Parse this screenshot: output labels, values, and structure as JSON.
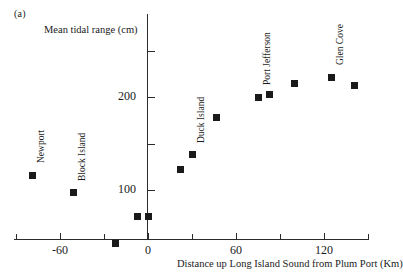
{
  "panel": {
    "label": "(a)"
  },
  "chart_data": {
    "type": "scatter",
    "title": "",
    "xlabel": "Distance up Long Island Sound from Plum Port (Km)",
    "ylabel": "Mean tidal range (cm)",
    "xlim": [
      -90,
      150
    ],
    "ylim": [
      0,
      270
    ],
    "grid": false,
    "legend": "none",
    "x_major_ticks": [
      -60,
      0,
      60,
      120
    ],
    "x_minor_ticks": [
      -90,
      -30,
      30,
      90,
      150
    ],
    "x_tick_labels": [
      "-60",
      "0",
      "60",
      "120"
    ],
    "y_major_ticks": [
      100,
      200
    ],
    "y_minor_ticks": [
      150,
      250
    ],
    "y_tick_labels": [
      "100",
      "200"
    ],
    "marker": "square",
    "marker_color": "#1a1a1a",
    "x": [
      -79,
      -51,
      -22,
      -7,
      0,
      22,
      30,
      47,
      75,
      83,
      100,
      125,
      141
    ],
    "y": [
      116,
      97,
      42,
      72,
      72,
      122,
      138,
      178,
      200,
      203,
      215,
      221,
      212
    ],
    "point_labels": [
      {
        "text": "Newport",
        "x": -79,
        "y": 116
      },
      {
        "text": "Block Island",
        "x": -51,
        "y": 97
      },
      {
        "text": "Duck Island",
        "x": 30,
        "y": 138
      },
      {
        "text": "Port Jefferson",
        "x": 75,
        "y": 200
      },
      {
        "text": "Glen Cove",
        "x": 125,
        "y": 221
      }
    ]
  }
}
